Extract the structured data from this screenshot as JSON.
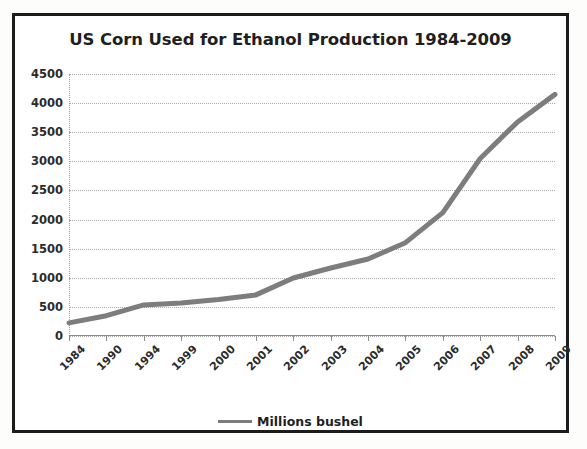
{
  "chart_data": {
    "type": "line",
    "title": "US Corn Used for Ethanol Production 1984-2009",
    "xlabel": "",
    "ylabel": "",
    "categories": [
      "1984",
      "1990",
      "1994",
      "1999",
      "2000",
      "2001",
      "2002",
      "2003",
      "2004",
      "2005",
      "2006",
      "2007",
      "2008",
      "2009"
    ],
    "series": [
      {
        "name": "Millions bushel",
        "color": "#7d7d7d",
        "values": [
          225,
          349,
          533,
          566,
          628,
          706,
          996,
          1168,
          1323,
          1603,
          2119,
          3049,
          3677,
          4150
        ]
      }
    ],
    "ylim": [
      0,
      4500
    ],
    "ytick_step": 500,
    "yticks": [
      "4500",
      "4000",
      "3500",
      "3000",
      "2500",
      "2000",
      "1500",
      "1000",
      "500",
      "0"
    ],
    "grid": true,
    "legend_position": "bottom",
    "legend_entries": [
      "Millions bushel"
    ]
  },
  "legend": {
    "label": "Millions bushel"
  },
  "colors": {
    "line": "#7d7d7d",
    "grid": "#a9a9a9",
    "text": "#1f1f1f",
    "border": "#1c1c1c"
  }
}
